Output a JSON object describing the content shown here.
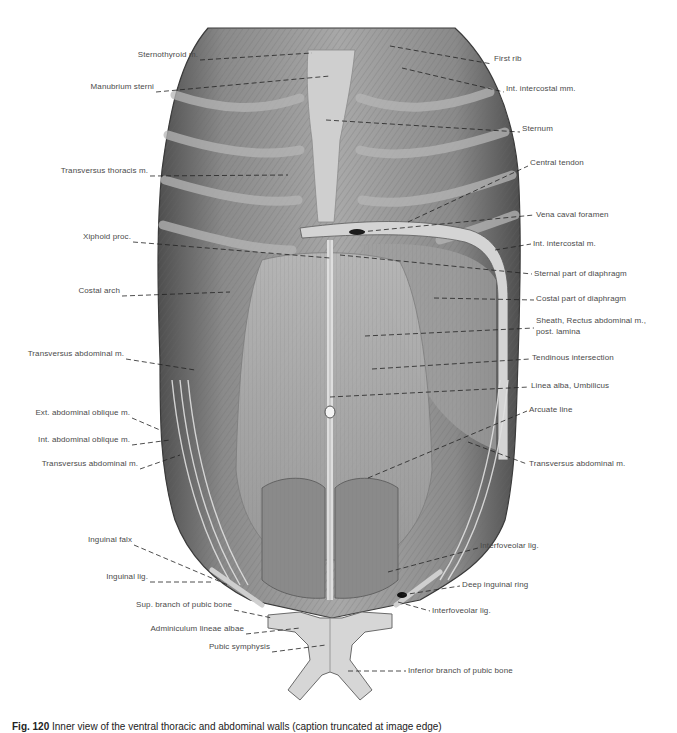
{
  "figure": {
    "caption_number": "Fig. 120",
    "caption_text": "Inner view of the ventral thoracic and abdominal walls (caption truncated at image edge)",
    "colors": {
      "tissue_dark": "#5a5a5a",
      "tissue_mid": "#8c8c8c",
      "tissue_light": "#c4c4c4",
      "bone": "#d8d8d8",
      "label_text": "#4a4a4a",
      "leader_line": "#222222"
    }
  },
  "labels_left": [
    {
      "text": "Sternothyroid m.",
      "x": 198,
      "y": 56
    },
    {
      "text": "Manubrium sterni",
      "x": 154,
      "y": 88
    },
    {
      "text": "Transversus thoracis m.",
      "x": 148,
      "y": 172
    },
    {
      "text": "Xiphoid proc.",
      "x": 131,
      "y": 238
    },
    {
      "text": "Costal arch",
      "x": 120,
      "y": 292
    },
    {
      "text": "Transversus abdominal m.",
      "x": 124,
      "y": 355
    },
    {
      "text": "Ext. abdominal oblique m.",
      "x": 130,
      "y": 414
    },
    {
      "text": "Int. abdominal oblique m.",
      "x": 130,
      "y": 441
    },
    {
      "text": "Transversus abdominal m.",
      "x": 138,
      "y": 465
    },
    {
      "text": "Inguinal falx",
      "x": 132,
      "y": 541
    },
    {
      "text": "Inguinal lig.",
      "x": 148,
      "y": 578
    },
    {
      "text": "Sup. branch of pubic bone",
      "x": 232,
      "y": 606
    },
    {
      "text": "Adminiculum lineae albae",
      "x": 244,
      "y": 630
    },
    {
      "text": "Pubic symphysis",
      "x": 270,
      "y": 648
    }
  ],
  "labels_right": [
    {
      "text": "First rib",
      "x": 494,
      "y": 60
    },
    {
      "text": "Int. intercostal mm.",
      "x": 506,
      "y": 88
    },
    {
      "text": "Sternum",
      "x": 522,
      "y": 128
    },
    {
      "text": "Central tendon",
      "x": 530,
      "y": 162
    },
    {
      "text": "Vena caval foramen",
      "x": 536,
      "y": 211
    },
    {
      "text": "Int. intercostal m.",
      "x": 533,
      "y": 240
    },
    {
      "text": "Sternal part of diaphragm",
      "x": 534,
      "y": 270
    },
    {
      "text": "Costal part of diaphragm",
      "x": 536,
      "y": 296
    },
    {
      "text": "Sheath, Rectus abdominal m.,",
      "x": 536,
      "y": 320
    },
    {
      "text": "post. lamina",
      "x": 536,
      "y": 331
    },
    {
      "text": "Tendinous intersection",
      "x": 532,
      "y": 355
    },
    {
      "text": "Linea alba, Umbilicus",
      "x": 531,
      "y": 383
    },
    {
      "text": "Arcuate line",
      "x": 529,
      "y": 407
    },
    {
      "text": "Transversus abdominal m.",
      "x": 529,
      "y": 460
    },
    {
      "text": "Interfoveolar lig.",
      "x": 480,
      "y": 544
    },
    {
      "text": "Deep inguinal ring",
      "x": 462,
      "y": 582
    },
    {
      "text": "Interfoveolar lig.",
      "x": 432,
      "y": 607
    },
    {
      "text": "Inferior branch of pubic bone",
      "x": 408,
      "y": 667
    }
  ]
}
